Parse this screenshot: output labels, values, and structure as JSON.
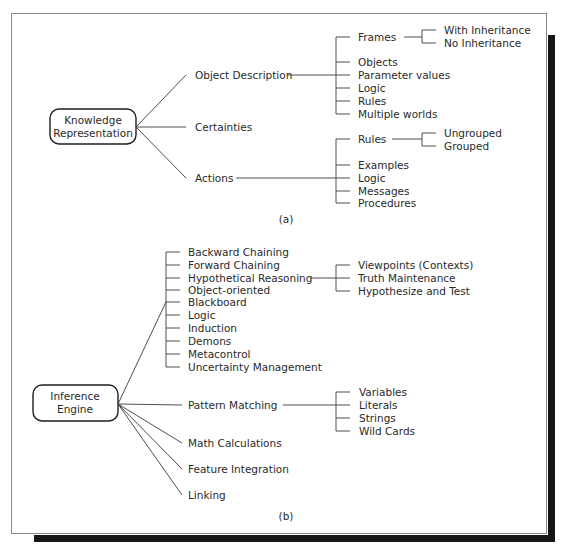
{
  "figure_a": {
    "caption": "(a)",
    "root": {
      "line1": "Knowledge",
      "line2": "Representation"
    },
    "branches": {
      "object_description": {
        "label": "Object Description",
        "children": {
          "frames": {
            "label": "Frames",
            "children": [
              "With Inheritance",
              "No Inheritance"
            ]
          },
          "items": [
            "Objects",
            "Parameter values",
            "Logic",
            "Rules",
            "Multiple worlds"
          ]
        }
      },
      "certainties": {
        "label": "Certainties"
      },
      "actions": {
        "label": "Actions",
        "children": {
          "rules": {
            "label": "Rules",
            "children": [
              "Ungrouped",
              "Grouped"
            ]
          },
          "items": [
            "Examples",
            "Logic",
            "Messages",
            "Procedures"
          ]
        }
      }
    }
  },
  "figure_b": {
    "caption": "(b)",
    "root": {
      "line1": "Inference",
      "line2": "Engine"
    },
    "strategies": {
      "items": [
        "Backward Chaining",
        "Forward Chaining",
        "Hypothetical Reasoning",
        "Object-oriented",
        "Blackboard",
        "Logic",
        "Induction",
        "Demons",
        "Metacontrol",
        "Uncertainty Management"
      ],
      "hypothetical_children": [
        "Viewpoints (Contexts)",
        "Truth Maintenance",
        "Hypothesize and Test"
      ]
    },
    "pattern_matching": {
      "label": "Pattern Matching",
      "children": [
        "Variables",
        "Literals",
        "Strings",
        "Wild Cards"
      ]
    },
    "others": [
      "Math Calculations",
      "Feature Integration",
      "Linking"
    ]
  },
  "colors": {
    "line": "#3a3a3a",
    "text": "#2a2a2a",
    "frame_border": "#8a8a8a",
    "shadow": "#161616",
    "background": "#ffffff"
  }
}
